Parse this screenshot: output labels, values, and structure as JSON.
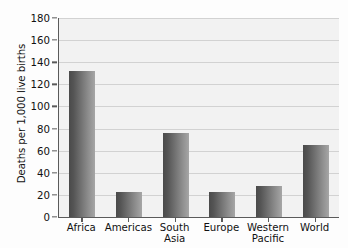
{
  "chart_data": {
    "type": "bar",
    "title": "",
    "xlabel": "",
    "ylabel": "Deaths per 1,000 live births",
    "ylim": [
      0,
      180
    ],
    "ytick_step": 20,
    "yticks": [
      0,
      20,
      40,
      60,
      80,
      100,
      120,
      140,
      160,
      180
    ],
    "categories": [
      "Africa",
      "Americas",
      "South Asia",
      "Europe",
      "Western Pacific",
      "World"
    ],
    "category_lines": [
      [
        "Africa"
      ],
      [
        "Americas"
      ],
      [
        "South",
        "Asia"
      ],
      [
        "Europe"
      ],
      [
        "Western",
        "Pacific"
      ],
      [
        "World"
      ]
    ],
    "values": [
      132,
      23,
      76,
      23,
      28,
      65
    ],
    "grid": "horizontal",
    "legend": "none",
    "bar_color_dark": "#4a4a4a",
    "bar_color_light": "#a6a6a6",
    "plot_background": "#f2f2f2",
    "gridline_color": "#d2d2d2",
    "axis_color": "#5a5a5a"
  }
}
